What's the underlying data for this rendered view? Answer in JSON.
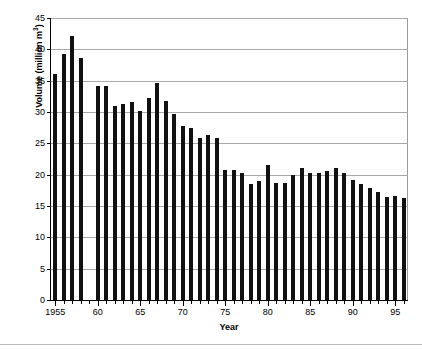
{
  "chart_data": {
    "type": "bar",
    "title": "",
    "xlabel": "Year",
    "ylabel": "Volume (million m³)",
    "ylabel_text": "Volume (million m",
    "ylabel_sup": "3",
    "ylabel_tail": ")",
    "ylim": [
      0,
      45
    ],
    "ytick_step": 5,
    "yticks": [
      0,
      5,
      10,
      15,
      20,
      25,
      30,
      35,
      40,
      45
    ],
    "ytick_labels": [
      "0",
      "5",
      "10",
      "15",
      "20",
      "25",
      "30",
      "35",
      "40",
      "45"
    ],
    "xlim": [
      1954.5,
      1996.5
    ],
    "xtick_labels": [
      "1955",
      "60",
      "65",
      "70",
      "75",
      "80",
      "85",
      "90",
      "95"
    ],
    "xtick_values": [
      1955,
      1960,
      1965,
      1970,
      1975,
      1980,
      1985,
      1990,
      1995
    ],
    "grid": "horizontal",
    "legend": "none",
    "bar_color": "#111111",
    "categories": [
      1955,
      1956,
      1957,
      1958,
      1960,
      1961,
      1962,
      1963,
      1964,
      1965,
      1966,
      1967,
      1968,
      1969,
      1970,
      1971,
      1972,
      1973,
      1974,
      1975,
      1976,
      1977,
      1978,
      1979,
      1980,
      1981,
      1982,
      1983,
      1984,
      1985,
      1986,
      1987,
      1988,
      1989,
      1990,
      1991,
      1992,
      1993,
      1994,
      1995,
      1996
    ],
    "values": [
      36.0,
      39.2,
      42.2,
      38.6,
      34.2,
      34.2,
      31.0,
      31.3,
      31.6,
      30.2,
      32.3,
      34.7,
      31.7,
      29.7,
      27.8,
      27.4,
      25.8,
      26.4,
      25.8,
      20.7,
      20.8,
      20.2,
      18.5,
      19.0,
      21.6,
      18.7,
      18.7,
      20.0,
      21.0,
      20.2,
      20.3,
      20.6,
      21.0,
      20.3,
      19.1,
      18.5,
      17.8,
      17.2,
      16.5,
      16.6,
      16.2
    ],
    "missing_years": [
      1959
    ],
    "note": "Bar chart of annual volume in million cubic metres, 1955-1996, with no data for 1959."
  }
}
